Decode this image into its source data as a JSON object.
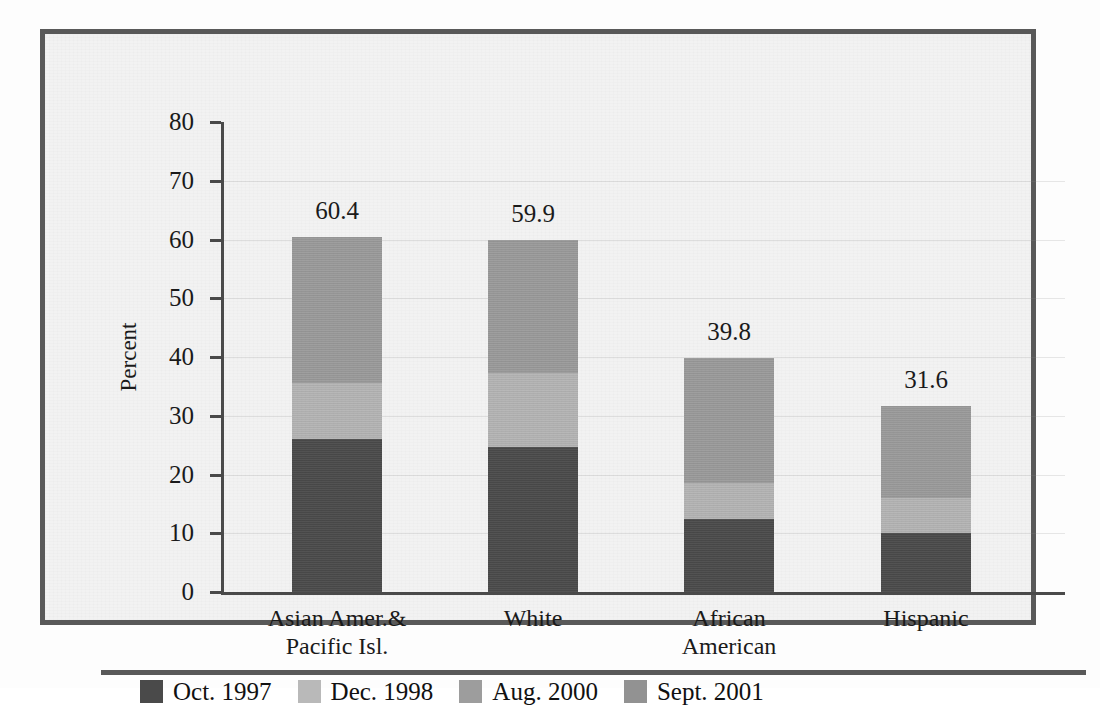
{
  "chart_data": {
    "type": "bar",
    "subtype": "stacked",
    "title": "",
    "xlabel": "",
    "ylabel": "Percent",
    "ylim": [
      0,
      80
    ],
    "ytick_step": 10,
    "yticks": [
      "80",
      "70",
      "60",
      "50",
      "40",
      "30",
      "20",
      "10",
      "0"
    ],
    "grid": true,
    "legend_position": "bottom-left",
    "categories": [
      "Asian Amer.&\nPacific Isl.",
      "White",
      "African\nAmerican",
      "Hispanic"
    ],
    "category_lines": [
      [
        "Asian Amer.&",
        "Pacific Isl."
      ],
      [
        "White",
        ""
      ],
      [
        "African",
        "American"
      ],
      [
        "Hispanic",
        ""
      ]
    ],
    "series": [
      {
        "name": "Oct. 1997",
        "color": "#4a4a4a",
        "values": [
          26.0,
          24.7,
          12.4,
          10.0
        ]
      },
      {
        "name": "Dec. 1998",
        "color": "#b4b4b4",
        "values": [
          9.6,
          12.6,
          6.1,
          6.0
        ]
      },
      {
        "name": "Aug. 2000",
        "color": "#9a9a9a",
        "values": [
          24.8,
          22.6,
          21.3,
          15.6
        ]
      },
      {
        "name": "Sept. 2001",
        "color": "#8f8f8f",
        "values": [
          0,
          0,
          0,
          0
        ]
      }
    ],
    "totals": [
      "60.4",
      "59.9",
      "39.8",
      "31.6"
    ],
    "total_values": [
      60.4,
      59.9,
      39.8,
      31.6
    ]
  },
  "legend": {
    "items": [
      {
        "label": "Oct. 1997",
        "color": "#4a4a4a"
      },
      {
        "label": "Dec. 1998",
        "color": "#b9b9b9"
      },
      {
        "label": "Aug. 2000",
        "color": "#9d9d9d"
      },
      {
        "label": "Sept. 2001",
        "color": "#929292"
      }
    ]
  },
  "colors": {
    "frame": "#595959",
    "panel_background": "#f2f2f2",
    "axis": "#4a4a4a",
    "text": "#1a1a1a"
  }
}
